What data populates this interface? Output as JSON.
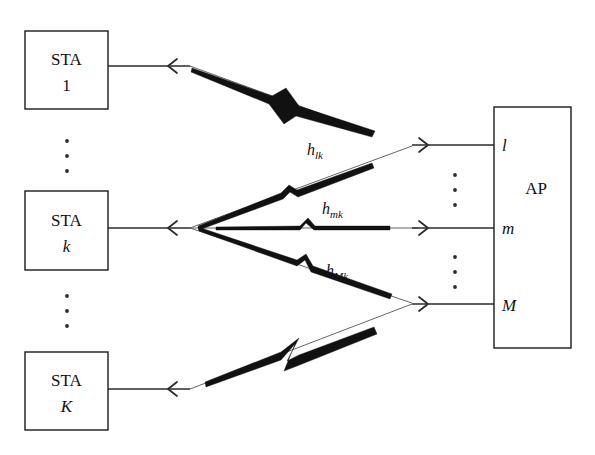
{
  "diagram": {
    "stations": [
      {
        "id": "sta-1",
        "name": "STA",
        "index": "1",
        "index_style": "upright"
      },
      {
        "id": "sta-k",
        "name": "STA",
        "index": "k",
        "index_style": "italic"
      },
      {
        "id": "sta-K",
        "name": "STA",
        "index": "K",
        "index_style": "italic"
      }
    ],
    "access_point": {
      "label": "AP",
      "antennas": [
        {
          "id": "antenna-l",
          "label": "l"
        },
        {
          "id": "antenna-m",
          "label": "m"
        },
        {
          "id": "antenna-M",
          "label": "M"
        }
      ]
    },
    "channels": [
      {
        "id": "channel-lk",
        "base": "h",
        "subscript": "lk",
        "from": "sta-k",
        "to": "antenna-l"
      },
      {
        "id": "channel-mk",
        "base": "h",
        "subscript": "mk",
        "from": "sta-k",
        "to": "antenna-m"
      },
      {
        "id": "channel-Mk",
        "base": "h",
        "subscript": "Mk",
        "from": "sta-k",
        "to": "antenna-M"
      }
    ],
    "ellipses": [
      {
        "id": "ellipsis-stations-upper",
        "glyph": "⋮"
      },
      {
        "id": "ellipsis-stations-lower",
        "glyph": "⋮"
      },
      {
        "id": "ellipsis-antennas-upper",
        "glyph": "⋮"
      },
      {
        "id": "ellipsis-antennas-lower",
        "glyph": "⋮"
      }
    ],
    "colors": {
      "line": "#2b2b2b",
      "bolt": "#111111",
      "box_stroke": "#1a1a1a",
      "background": "#ffffff",
      "text": "#111111"
    }
  }
}
